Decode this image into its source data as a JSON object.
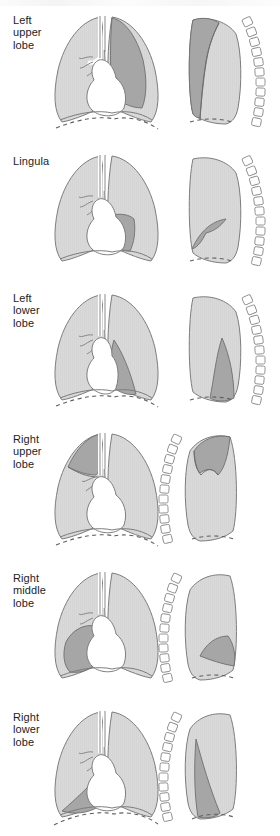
{
  "figure": {
    "panel_count": 6,
    "views_per_panel": [
      "frontal",
      "lateral"
    ]
  },
  "colors": {
    "lung_fill": "#d9d9d9",
    "lobe_highlight": "#a6a6a6",
    "outline": "#7d7d7d",
    "mediastinum": "#ffffff",
    "vertebra_fill": "#ffffff",
    "vertebra_outline": "#8a8a8a",
    "diaphragm_dash": "#6f6f6f",
    "text": "#1d1d1d",
    "background": "#ffffff"
  },
  "panels": [
    {
      "id": "left-upper-lobe",
      "label": "Left\nupper\nlobe",
      "label_lines": [
        "Left",
        "upper",
        "lobe"
      ],
      "side": "left",
      "lobe": "upper",
      "lateral_view": "left lateral",
      "vertebrae_side": "right",
      "vertebrae_count": 11
    },
    {
      "id": "lingula",
      "label": "Lingula",
      "label_lines": [
        "Lingula"
      ],
      "side": "left",
      "lobe": "lingula",
      "lateral_view": "left lateral",
      "vertebrae_side": "right",
      "vertebrae_count": 11
    },
    {
      "id": "left-lower-lobe",
      "label": "Left\nlower\nlobe",
      "label_lines": [
        "Left",
        "lower",
        "lobe"
      ],
      "side": "left",
      "lobe": "lower",
      "lateral_view": "left lateral",
      "vertebrae_side": "right",
      "vertebrae_count": 11
    },
    {
      "id": "right-upper-lobe",
      "label": "Right\nupper\nlobe",
      "label_lines": [
        "Right",
        "upper",
        "lobe"
      ],
      "side": "right",
      "lobe": "upper",
      "lateral_view": "right lateral",
      "vertebrae_side": "left",
      "vertebrae_count": 11
    },
    {
      "id": "right-middle-lobe",
      "label": "Right\nmiddle\nlobe",
      "label_lines": [
        "Right",
        "middle",
        "lobe"
      ],
      "side": "right",
      "lobe": "middle",
      "lateral_view": "right lateral",
      "vertebrae_side": "left",
      "vertebrae_count": 11
    },
    {
      "id": "right-lower-lobe",
      "label": "Right\nlower\nlobe",
      "label_lines": [
        "Right",
        "lower",
        "lobe"
      ],
      "side": "right",
      "lobe": "lower",
      "lateral_view": "right lateral",
      "vertebrae_side": "left",
      "vertebrae_count": 11
    }
  ]
}
